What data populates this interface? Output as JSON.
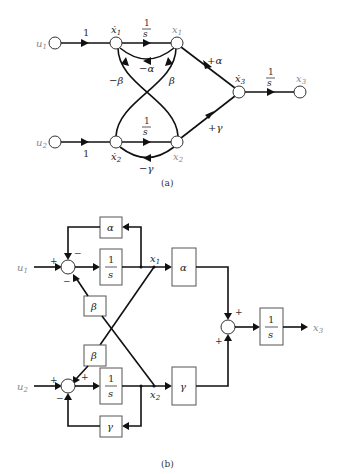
{
  "figure_a": {
    "caption": "(a)",
    "nodes": {
      "u1": "u",
      "u1_sub": "1",
      "u2": "u",
      "u2_sub": "2",
      "x1dot": "ẋ",
      "x1dot_sub": "1",
      "x1": "x",
      "x1_sub": "1",
      "x2dot": "ẋ",
      "x2dot_sub": "2",
      "x2": "x",
      "x2_sub": "2",
      "x3dot": "ẋ",
      "x3dot_sub": "3",
      "x3": "x",
      "x3_sub": "3"
    },
    "gains": {
      "u1_to_x1dot": "1",
      "u2_to_x2dot": "1",
      "integrator_num": "1",
      "integrator_den": "s",
      "fb_alpha": "−α",
      "fb_gamma": "−γ",
      "cross_minus_beta": "−β",
      "cross_beta": "β",
      "to_x3_alpha": "+α",
      "to_x3_gamma": "+γ"
    }
  },
  "figure_b": {
    "caption": "(b)",
    "inputs": {
      "u1": "u",
      "u1_sub": "1",
      "u2": "u",
      "u2_sub": "2"
    },
    "outputs": {
      "x1": "x",
      "x1_sub": "1",
      "x2": "x",
      "x2_sub": "2",
      "x3": "x",
      "x3_sub": "3"
    },
    "blocks": {
      "alpha_fb": "α",
      "integrator_num": "1",
      "integrator_den": "s",
      "beta_upper": "β",
      "beta_lower": "β",
      "gamma_fb": "γ",
      "alpha_out": "α",
      "gamma_out": "γ"
    },
    "signs": {
      "sum1_input": "+",
      "sum1_top": "−",
      "sum1_bottom": "−",
      "sum2_input": "+",
      "sum2_top": "+",
      "sum2_bottom": "−",
      "sum3_top": "+",
      "sum3_bottom": "+"
    }
  }
}
